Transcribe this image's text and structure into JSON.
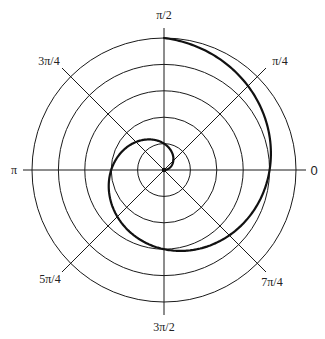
{
  "chart_data": {
    "type": "line",
    "subtype": "polar",
    "title": "",
    "radial_rings": [
      1,
      2,
      3,
      4,
      5
    ],
    "radial_max": 5,
    "angle_labels": [
      {
        "angle_deg": 0,
        "label": "0"
      },
      {
        "angle_deg": 45,
        "label": "π/4"
      },
      {
        "angle_deg": 90,
        "label": "π/2"
      },
      {
        "angle_deg": 135,
        "label": "3π/4"
      },
      {
        "angle_deg": 180,
        "label": "π"
      },
      {
        "angle_deg": 225,
        "label": "5π/4"
      },
      {
        "angle_deg": 270,
        "label": "3π/2"
      },
      {
        "angle_deg": 315,
        "label": "7π/4"
      }
    ],
    "series": [
      {
        "name": "spiral",
        "equation": "r = 2θ/π",
        "theta_start": 0,
        "theta_end": 7.853981634,
        "points": [
          {
            "theta": 0,
            "r": 0
          },
          {
            "theta": 1.5708,
            "r": 1
          },
          {
            "theta": 3.1416,
            "r": 2
          },
          {
            "theta": 4.7124,
            "r": 3
          },
          {
            "theta": 6.2832,
            "r": 4
          },
          {
            "theta": 7.854,
            "r": 5
          }
        ]
      }
    ],
    "grid": true,
    "legend": "none"
  },
  "colors": {
    "grid": "#1a1a1a",
    "curve": "#111111",
    "background": "#ffffff"
  },
  "labels": {
    "a0": "0",
    "a45": "π/4",
    "a90": "π/2",
    "a135": "3π/4",
    "a180": "π",
    "a225": "5π/4",
    "a270": "3π/2",
    "a315": "7π/4"
  }
}
